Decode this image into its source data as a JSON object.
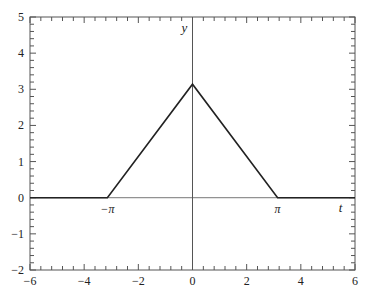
{
  "chart_data": {
    "type": "line",
    "title": "",
    "xlabel": "t",
    "ylabel": "y",
    "xlim": [
      -6,
      6
    ],
    "ylim": [
      -2,
      5
    ],
    "grid": false,
    "x_ticks": [
      -6,
      -4,
      -2,
      0,
      2,
      4,
      6
    ],
    "x_tick_labels": [
      "−6",
      "−4",
      "−2",
      "0",
      "2",
      "4",
      "6"
    ],
    "y_ticks": [
      -2,
      -1,
      0,
      1,
      2,
      3,
      4,
      5
    ],
    "y_tick_labels": [
      "−2",
      "−1",
      "0",
      "1",
      "2",
      "3",
      "4",
      "5"
    ],
    "x_minor_step": 0.4,
    "y_minor_step": 0.2,
    "annotations": [
      {
        "text": "−π",
        "x": -3.14159,
        "y": 0
      },
      {
        "text": "π",
        "x": 3.14159,
        "y": 0
      }
    ],
    "series": [
      {
        "name": "triangle pulse",
        "x": [
          -6,
          -3.14159,
          0,
          3.14159,
          6
        ],
        "y": [
          0,
          0,
          3.14159,
          0,
          0
        ]
      }
    ]
  },
  "labels": {
    "x_axis_name": "t",
    "y_axis_name": "y",
    "neg_pi": "−π",
    "pi": "π"
  }
}
